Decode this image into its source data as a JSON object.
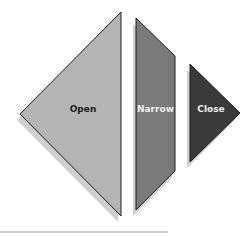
{
  "diagram": {
    "shapes": [
      {
        "id": "open",
        "label": "Open",
        "fill": "#b4b4b4",
        "text_color": "#1a1a1a"
      },
      {
        "id": "narrow",
        "label": "Narrow",
        "fill": "#7a7a7a",
        "text_color": "#eeeeee"
      },
      {
        "id": "close",
        "label": "Close",
        "fill": "#3a3a3a",
        "text_color": "#eeeeee"
      }
    ],
    "colors": {
      "shadow": "#cfcfcf",
      "outline": "#1e1e1e",
      "baseline": "#9a9a9a"
    }
  }
}
